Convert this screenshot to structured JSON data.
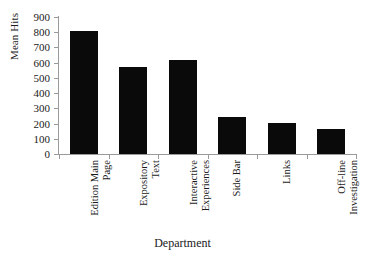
{
  "chart_data": {
    "type": "bar",
    "title": "",
    "xlabel": "Department",
    "ylabel": "Mean Hits",
    "ylim": [
      0,
      900
    ],
    "ytick_step": 100,
    "yticks": [
      900,
      800,
      700,
      600,
      500,
      400,
      300,
      200,
      100,
      0
    ],
    "grid": false,
    "legend": false,
    "bar_color": "#0a0a0a",
    "axis_color": "#9a9a9a",
    "background": "#ffffff",
    "categories": [
      "Edition Main Page",
      "Expository Text",
      "Interactive Experiences",
      "Side Bar",
      "Links",
      "Off-line Investigation"
    ],
    "category_lines": [
      [
        "Edition Main",
        "Page"
      ],
      [
        "Expository",
        "Text"
      ],
      [
        "Interactive",
        "Experiences"
      ],
      [
        "Side Bar",
        ""
      ],
      [
        "Links",
        ""
      ],
      [
        "Off-line",
        "Investigation"
      ]
    ],
    "values": [
      805,
      570,
      620,
      240,
      205,
      165
    ]
  }
}
